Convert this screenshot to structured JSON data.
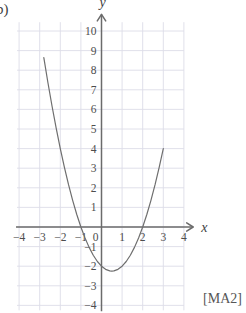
{
  "part_label": "b)",
  "reference_label": "[MA2]",
  "colors": {
    "grid": "#dcdce8",
    "axis": "#6b6b6b",
    "curve": "#6e6e6e",
    "text": "#4d4d4d",
    "background": "#ffffff"
  },
  "axes": {
    "x_name": "x",
    "y_name": "y",
    "x_ticks": [
      "-4",
      "-3",
      "-2",
      "-1",
      "1",
      "2",
      "3",
      "4"
    ],
    "y_ticks": [
      "10",
      "9",
      "8",
      "7",
      "6",
      "5",
      "4",
      "3",
      "2",
      "1",
      "-1",
      "-2",
      "-3",
      "-4"
    ],
    "origin_label": "0"
  },
  "chart_data": {
    "type": "line",
    "title": "",
    "xlabel": "x",
    "ylabel": "y",
    "xlim": [
      -4,
      4
    ],
    "ylim": [
      -4,
      10
    ],
    "grid": true,
    "legend": "none",
    "xticks": [
      -4,
      -3,
      -2,
      -1,
      0,
      1,
      2,
      3,
      4
    ],
    "yticks": [
      -4,
      -3,
      -2,
      -1,
      0,
      1,
      2,
      3,
      4,
      5,
      6,
      7,
      8,
      9,
      10
    ],
    "series": [
      {
        "name": "y = x^2 - x - 2",
        "x": [
          -2.8,
          -2.6,
          -2.4,
          -2.2,
          -2.0,
          -1.8,
          -1.6,
          -1.4,
          -1.2,
          -1.0,
          -0.8,
          -0.6,
          -0.4,
          -0.2,
          0.0,
          0.2,
          0.4,
          0.5,
          0.6,
          0.8,
          1.0,
          1.2,
          1.4,
          1.6,
          1.8,
          2.0,
          2.2,
          2.4,
          2.6,
          2.8,
          3.0
        ],
        "y": [
          8.64,
          7.36,
          6.16,
          5.04,
          4.0,
          3.04,
          2.16,
          1.36,
          0.64,
          0.0,
          -0.56,
          -1.04,
          -1.44,
          -1.76,
          -2.0,
          -2.16,
          -2.24,
          -2.25,
          -2.24,
          -2.16,
          -2.0,
          -1.76,
          -1.44,
          -1.04,
          -0.56,
          0.0,
          0.64,
          1.36,
          2.16,
          3.04,
          4.0
        ]
      }
    ],
    "annotations": {
      "roots": [
        -1,
        2
      ],
      "y_intercept": -2,
      "vertex": [
        0.5,
        -2.25
      ]
    }
  }
}
